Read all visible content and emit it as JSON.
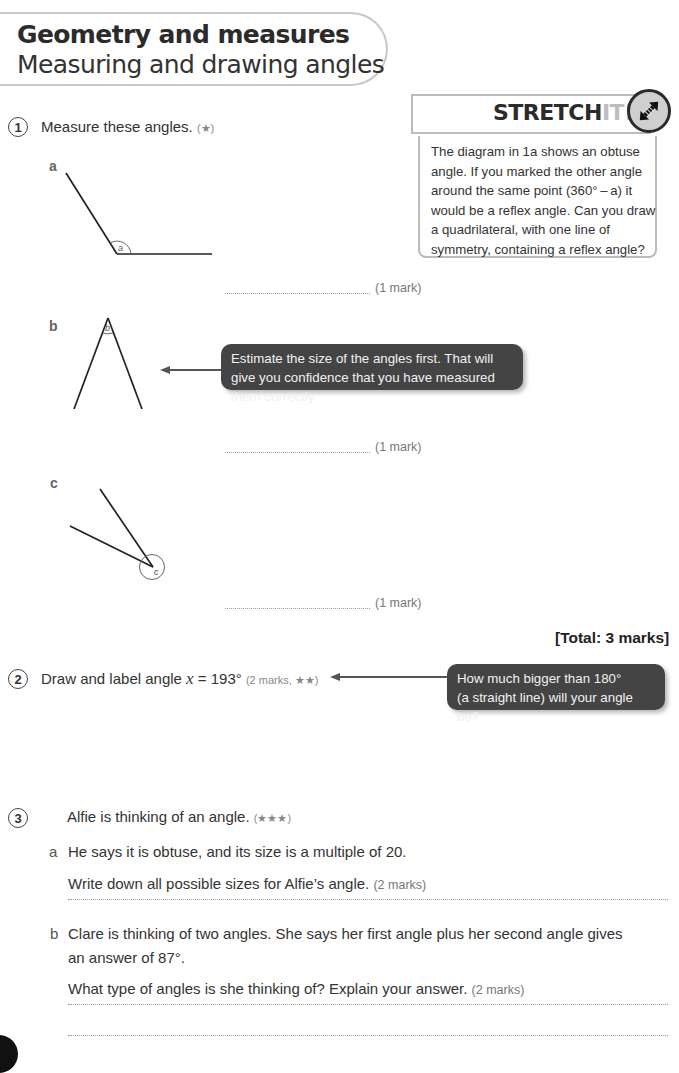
{
  "header": {
    "title": "Geometry and measures",
    "subtitle": "Measuring and drawing angles"
  },
  "stretch_it": {
    "label_dark": "STRETCH",
    "label_light": "IT!",
    "icon": "double-arrow-icon",
    "text": "The diagram in 1a shows an obtuse angle. If you marked the other angle around the same point (360° – a) it would be a reflex angle. Can you draw a quadrilateral, with one line of symmetry, containing a reflex angle?"
  },
  "q1": {
    "number": "1",
    "text": "Measure these angles.",
    "stars": "(★)",
    "parts": [
      {
        "label": "a",
        "angle_label": "a",
        "mark": "(1 mark)"
      },
      {
        "label": "b",
        "angle_label": "b",
        "mark": "(1 mark)"
      },
      {
        "label": "c",
        "angle_label": "c",
        "mark": "(1 mark)"
      }
    ],
    "tip": "Estimate the size of the angles first. That will give you confidence that you have measured them correctly.",
    "total": "[Total: 3 marks]"
  },
  "q2": {
    "number": "2",
    "text_prefix": "Draw and label angle",
    "variable": "x",
    "text_suffix": "= 193°",
    "marks": "(2 marks, ★★)",
    "tip_line1": "How much bigger than 180°",
    "tip_line2": "(a straight line) will your angle be?"
  },
  "q3": {
    "number": "3",
    "text": "Alfie is thinking of an angle.",
    "stars": "(★★★)",
    "a": {
      "label": "a",
      "line1": "He says it is obtuse, and its size is a multiple of 20.",
      "line2": "Write down all possible sizes for Alfie’s angle.",
      "marks": "(2 marks)"
    },
    "b": {
      "label": "b",
      "line1": "Clare is thinking of two angles. She says her first angle plus her second angle gives",
      "line2": "an answer of 87°.",
      "line3": "What type of angles is she thinking of? Explain your answer.",
      "marks": "(2 marks)"
    }
  }
}
